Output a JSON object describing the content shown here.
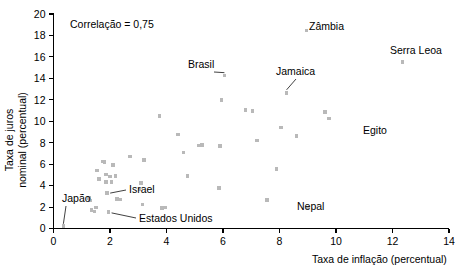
{
  "chart_data": {
    "type": "scatter",
    "title": "",
    "xlabel": "Taxa de inflação (percentual)",
    "ylabel_line1": "Taxa de juros",
    "ylabel_line2": "nominal (percentual)",
    "xlim": [
      0,
      14
    ],
    "ylim": [
      0,
      20
    ],
    "xticks": [
      0,
      2,
      4,
      6,
      8,
      10,
      12,
      14
    ],
    "yticks": [
      0,
      2,
      4,
      6,
      8,
      10,
      12,
      14,
      16,
      18,
      20
    ],
    "xtick_labels": [
      "0",
      "2",
      "4",
      "6",
      "8",
      "10",
      "12",
      "14"
    ],
    "ytick_labels": [
      "0",
      "2",
      "4",
      "6",
      "8",
      "10",
      "12",
      "14",
      "16",
      "18",
      "20"
    ],
    "grid": false,
    "legend": "none",
    "marker_color": "#b9b9b9",
    "marker_shape": "square",
    "annotation_note": "Correlação = 0,75",
    "points": [
      {
        "x": 0.35,
        "y": 0.25,
        "label": "Japão"
      },
      {
        "x": 1.25,
        "y": 2.85,
        "label": ""
      },
      {
        "x": 1.3,
        "y": 2.6,
        "label": ""
      },
      {
        "x": 1.35,
        "y": 1.75,
        "label": ""
      },
      {
        "x": 1.45,
        "y": 1.6,
        "label": ""
      },
      {
        "x": 1.5,
        "y": 1.95,
        "label": ""
      },
      {
        "x": 1.55,
        "y": 5.4,
        "label": ""
      },
      {
        "x": 1.6,
        "y": 4.6,
        "label": ""
      },
      {
        "x": 1.75,
        "y": 6.25,
        "label": ""
      },
      {
        "x": 1.8,
        "y": 6.2,
        "label": ""
      },
      {
        "x": 1.85,
        "y": 4.35,
        "label": ""
      },
      {
        "x": 1.85,
        "y": 5.05,
        "label": ""
      },
      {
        "x": 1.9,
        "y": 3.3,
        "label": "Israel"
      },
      {
        "x": 1.95,
        "y": 1.55,
        "label": "Estados Unidos"
      },
      {
        "x": 2.0,
        "y": 4.85,
        "label": ""
      },
      {
        "x": 2.05,
        "y": 4.35,
        "label": ""
      },
      {
        "x": 2.1,
        "y": 5.9,
        "label": ""
      },
      {
        "x": 2.2,
        "y": 4.9,
        "label": ""
      },
      {
        "x": 2.25,
        "y": 2.75,
        "label": ""
      },
      {
        "x": 2.35,
        "y": 2.7,
        "label": ""
      },
      {
        "x": 2.7,
        "y": 6.7,
        "label": ""
      },
      {
        "x": 3.05,
        "y": 3.65,
        "label": ""
      },
      {
        "x": 3.1,
        "y": 4.25,
        "label": ""
      },
      {
        "x": 3.2,
        "y": 6.4,
        "label": ""
      },
      {
        "x": 3.15,
        "y": 2.25,
        "label": ""
      },
      {
        "x": 3.75,
        "y": 10.5,
        "label": ""
      },
      {
        "x": 3.85,
        "y": 1.9,
        "label": ""
      },
      {
        "x": 3.95,
        "y": 1.95,
        "label": ""
      },
      {
        "x": 4.4,
        "y": 8.75,
        "label": ""
      },
      {
        "x": 4.6,
        "y": 7.1,
        "label": ""
      },
      {
        "x": 4.75,
        "y": 4.9,
        "label": ""
      },
      {
        "x": 5.15,
        "y": 7.75,
        "label": ""
      },
      {
        "x": 5.25,
        "y": 7.8,
        "label": ""
      },
      {
        "x": 5.85,
        "y": 3.75,
        "label": ""
      },
      {
        "x": 5.9,
        "y": 7.7,
        "label": ""
      },
      {
        "x": 5.95,
        "y": 12.0,
        "label": ""
      },
      {
        "x": 6.05,
        "y": 14.25,
        "label": "Brasil"
      },
      {
        "x": 6.8,
        "y": 11.05,
        "label": ""
      },
      {
        "x": 7.05,
        "y": 10.95,
        "label": ""
      },
      {
        "x": 7.2,
        "y": 8.2,
        "label": ""
      },
      {
        "x": 7.55,
        "y": 2.65,
        "label": ""
      },
      {
        "x": 7.9,
        "y": 5.55,
        "label": ""
      },
      {
        "x": 8.05,
        "y": 9.4,
        "label": ""
      },
      {
        "x": 8.25,
        "y": 12.65,
        "label": "Jamaica"
      },
      {
        "x": 8.95,
        "y": 18.45,
        "label": "Zâmbia"
      },
      {
        "x": 8.6,
        "y": 8.6,
        "label": ""
      },
      {
        "x": 9.0,
        "y": 1.95,
        "label": "Nepal"
      },
      {
        "x": 9.6,
        "y": 10.85,
        "label": ""
      },
      {
        "x": 9.75,
        "y": 10.25,
        "label": "Egito"
      },
      {
        "x": 12.35,
        "y": 15.5,
        "label": "Serra Leoa"
      }
    ],
    "labeled_points": [
      {
        "name": "Japão",
        "x": 0.35,
        "y": 0.25
      },
      {
        "name": "Israel",
        "x": 1.9,
        "y": 3.3
      },
      {
        "name": "Estados Unidos",
        "x": 1.95,
        "y": 1.55
      },
      {
        "name": "Brasil",
        "x": 6.05,
        "y": 14.25
      },
      {
        "name": "Jamaica",
        "x": 8.25,
        "y": 12.65
      },
      {
        "name": "Zâmbia",
        "x": 8.95,
        "y": 18.45
      },
      {
        "name": "Nepal",
        "x": 9.0,
        "y": 1.95
      },
      {
        "name": "Egito",
        "x": 9.75,
        "y": 10.25
      },
      {
        "name": "Serra Leoa",
        "x": 12.35,
        "y": 15.5
      }
    ]
  },
  "annotations": {
    "correlation": "Correlação = 0,75",
    "brasil": "Brasil",
    "zambia": "Zâmbia",
    "jamaica": "Jamaica",
    "serra_leoa": "Serra Leoa",
    "egito": "Egito",
    "nepal": "Nepal",
    "japao": "Japão",
    "israel": "Israel",
    "estados_unidos": "Estados Unidos"
  },
  "axes": {
    "x_title": "Taxa de inflação (percentual)",
    "y_title_line1": "Taxa de juros",
    "y_title_line2": "nominal (percentual)",
    "x_labels": [
      "0",
      "2",
      "4",
      "6",
      "8",
      "10",
      "12",
      "14"
    ],
    "y_labels": [
      "0",
      "2",
      "4",
      "6",
      "8",
      "10",
      "12",
      "14",
      "16",
      "18",
      "20"
    ]
  }
}
